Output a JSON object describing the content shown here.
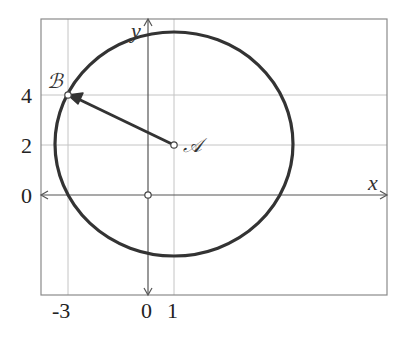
{
  "diagram": {
    "type": "coordinate-plane-circle",
    "axes": {
      "x_label": "x",
      "y_label": "y",
      "x_ticks": [
        "-3",
        "0",
        "1"
      ],
      "y_ticks": [
        "4",
        "2",
        "0"
      ]
    },
    "points": {
      "A": {
        "label": "𝒜",
        "x": 1,
        "y": 2
      },
      "B": {
        "label": "ℬ",
        "x": -3,
        "y": 4
      },
      "origin": {
        "x": 0,
        "y": 0
      }
    },
    "circle": {
      "center": "A",
      "through": "B",
      "radius_squared": 20
    },
    "vector": {
      "from": "A",
      "to": "B"
    },
    "colors": {
      "circle": "#333333",
      "grid": "#bdbdbd",
      "frame": "#888888",
      "axis": "#555555"
    }
  }
}
